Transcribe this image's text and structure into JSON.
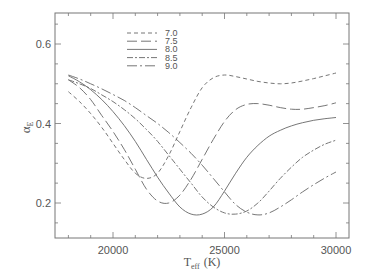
{
  "chart_data": {
    "type": "line",
    "title": "",
    "xlabel": "T_eff (K)",
    "xlabel_main": "T",
    "xlabel_sub": "eff",
    "xlabel_unit": "(K)",
    "ylabel": "α_E",
    "ylabel_main": "α",
    "ylabel_sub": "E",
    "xlim": [
      17400,
      30600
    ],
    "ylim": [
      0.115,
      0.68
    ],
    "xticks": [
      20000,
      25000,
      30000
    ],
    "xtick_labels": [
      "20000",
      "25000",
      "30000"
    ],
    "yticks": [
      0.2,
      0.4,
      0.6
    ],
    "ytick_labels": [
      "0.2",
      "0.4",
      "0.6"
    ],
    "grid": false,
    "legend_position": "upper-left-inside",
    "series": [
      {
        "name": "7.0",
        "dash": "4,3",
        "x": [
          18000,
          18500,
          19000,
          19500,
          20000,
          20500,
          21000,
          21500,
          22000,
          22500,
          23000,
          23500,
          24000,
          24500,
          25000,
          25500,
          26000,
          26500,
          27000,
          27500,
          28000,
          28500,
          29000,
          29500,
          30000
        ],
        "values": [
          0.48,
          0.455,
          0.425,
          0.39,
          0.35,
          0.31,
          0.275,
          0.262,
          0.275,
          0.32,
          0.38,
          0.44,
          0.49,
          0.515,
          0.522,
          0.518,
          0.512,
          0.506,
          0.502,
          0.5,
          0.502,
          0.507,
          0.513,
          0.52,
          0.527
        ]
      },
      {
        "name": "7.5",
        "dash": "10,4",
        "x": [
          18000,
          18500,
          19000,
          19500,
          20000,
          20500,
          21000,
          21500,
          22000,
          22500,
          23000,
          23500,
          24000,
          24500,
          25000,
          25500,
          26000,
          26500,
          27000,
          27500,
          28000,
          28500,
          29000,
          29500,
          30000
        ],
        "values": [
          0.51,
          0.49,
          0.46,
          0.42,
          0.38,
          0.335,
          0.285,
          0.235,
          0.205,
          0.2,
          0.22,
          0.26,
          0.31,
          0.36,
          0.405,
          0.435,
          0.448,
          0.45,
          0.446,
          0.44,
          0.436,
          0.436,
          0.44,
          0.445,
          0.452
        ]
      },
      {
        "name": "8.0",
        "dash": "none",
        "x": [
          18000,
          18500,
          19000,
          19500,
          20000,
          20500,
          21000,
          21500,
          22000,
          22500,
          23000,
          23500,
          24000,
          24500,
          25000,
          25500,
          26000,
          26500,
          27000,
          27500,
          28000,
          28500,
          29000,
          29500,
          30000
        ],
        "values": [
          0.52,
          0.505,
          0.485,
          0.46,
          0.43,
          0.395,
          0.355,
          0.31,
          0.265,
          0.225,
          0.19,
          0.172,
          0.172,
          0.19,
          0.23,
          0.275,
          0.315,
          0.345,
          0.368,
          0.383,
          0.394,
          0.402,
          0.408,
          0.412,
          0.415
        ]
      },
      {
        "name": "8.5",
        "dash": "6,2,2,2",
        "x": [
          18000,
          18500,
          19000,
          19500,
          20000,
          20500,
          21000,
          21500,
          22000,
          22500,
          23000,
          23500,
          24000,
          24500,
          25000,
          25500,
          26000,
          26500,
          27000,
          27500,
          28000,
          28500,
          29000,
          29500,
          30000
        ],
        "values": [
          0.51,
          0.5,
          0.488,
          0.472,
          0.455,
          0.435,
          0.412,
          0.385,
          0.355,
          0.32,
          0.285,
          0.25,
          0.215,
          0.19,
          0.175,
          0.172,
          0.18,
          0.2,
          0.23,
          0.262,
          0.29,
          0.315,
          0.333,
          0.348,
          0.358
        ]
      },
      {
        "name": "9.0",
        "dash": "10,3,2,3",
        "x": [
          18000,
          18500,
          19000,
          19500,
          20000,
          20500,
          21000,
          21500,
          22000,
          22500,
          23000,
          23500,
          24000,
          24500,
          25000,
          25500,
          26000,
          26500,
          27000,
          27500,
          28000,
          28500,
          29000,
          29500,
          30000
        ],
        "values": [
          0.522,
          0.512,
          0.5,
          0.487,
          0.473,
          0.458,
          0.44,
          0.42,
          0.4,
          0.377,
          0.352,
          0.325,
          0.295,
          0.262,
          0.228,
          0.196,
          0.177,
          0.17,
          0.175,
          0.19,
          0.208,
          0.228,
          0.246,
          0.263,
          0.278
        ]
      }
    ]
  },
  "colors": {
    "axis": "#777777",
    "line": "#666666",
    "text": "#555555",
    "background": "#ffffff"
  }
}
